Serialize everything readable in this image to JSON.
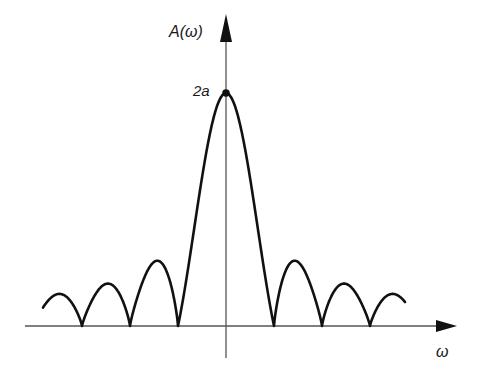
{
  "figure": {
    "y_axis_label": "A(ω)",
    "x_axis_label": "ω",
    "peak_label": "2a",
    "colors": {
      "curve": "#111111",
      "axis": "#555555",
      "background": "#ffffff"
    }
  },
  "diagram": {
    "type": "amplitude-spectrum",
    "main_lobe_peak": "2a",
    "side_lobes_each_side": 3
  }
}
